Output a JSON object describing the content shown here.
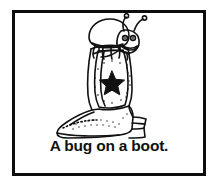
{
  "card": {
    "border_color": "#0d0d0d",
    "background_color": "#ffffff"
  },
  "illustration": {
    "name": "bug-on-a-boot-line-art",
    "style": "black-and-white line drawing",
    "ink_color": "#111111",
    "subjects": [
      {
        "name": "bug",
        "description": "smiling cartoon bug with domed shell, two antennae with round tips, large eyes and wide grin, sitting on top of the boot with legs dangling over the collar"
      },
      {
        "name": "boot",
        "description": "cowboy boot with tall shaft, stitched toe, angled heel and a solid five-pointed star on the shaft surrounded by a ring of stipple dots"
      }
    ],
    "star_color": "#111111"
  },
  "caption": {
    "text": "A bug on a boot."
  }
}
